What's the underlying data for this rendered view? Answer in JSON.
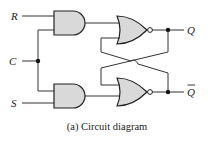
{
  "diagram": {
    "inputs": {
      "r": "R",
      "c": "C",
      "s": "S"
    },
    "outputs": {
      "q": "Q",
      "q_bar": "Q"
    },
    "gates": [
      {
        "id": "and-top",
        "type": "AND",
        "inputs": [
          "R",
          "C"
        ],
        "output": "to nor-top"
      },
      {
        "id": "and-bottom",
        "type": "AND",
        "inputs": [
          "C",
          "S"
        ],
        "output": "to nor-bottom"
      },
      {
        "id": "nor-top",
        "type": "NOR",
        "inputs": [
          "and-top",
          "Q_bar feedback"
        ],
        "output": "Q"
      },
      {
        "id": "nor-bottom",
        "type": "NOR",
        "inputs": [
          "Q feedback",
          "and-bottom"
        ],
        "output": "Q_bar"
      }
    ],
    "colors": {
      "gate_fill": "#d9d9d9",
      "stroke": "#222222"
    },
    "caption": "(a) Circuit diagram"
  }
}
